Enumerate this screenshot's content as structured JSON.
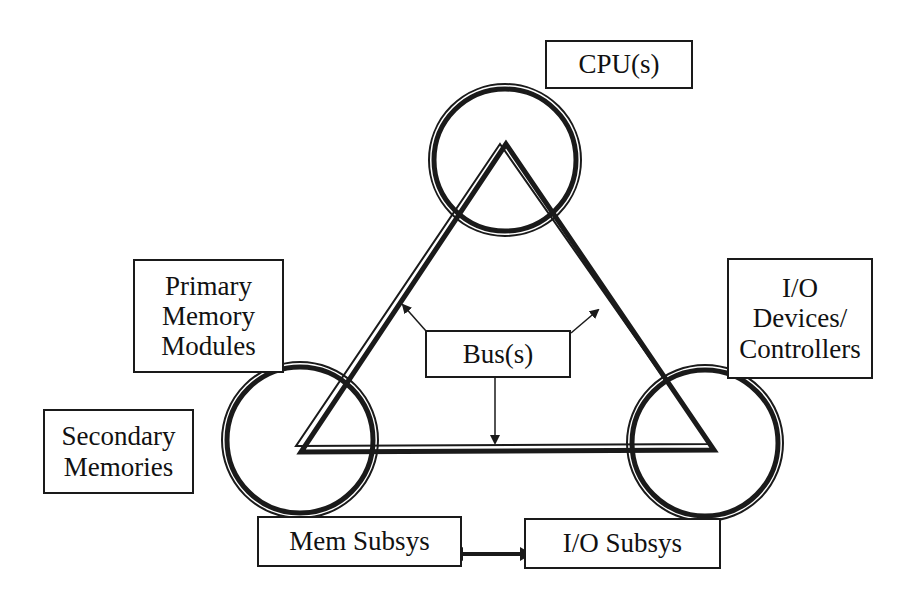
{
  "diagram": {
    "type": "system-architecture",
    "nodes": {
      "cpu": {
        "label": "CPU(s)"
      },
      "primary_memory": {
        "lines": [
          "Primary",
          "Memory",
          "Modules"
        ]
      },
      "secondary_memory": {
        "lines": [
          "Secondary",
          "Memories"
        ]
      },
      "io_devices": {
        "lines": [
          "I/O",
          "Devices/",
          "Controllers"
        ]
      },
      "bus": {
        "label": "Bus(s)"
      },
      "mem_subsys": {
        "label": "Mem Subsys"
      },
      "io_subsys": {
        "label": "I/O Subsys"
      }
    },
    "edges": [
      {
        "from": "cpu",
        "to": "mem_subsys",
        "kind": "bus"
      },
      {
        "from": "cpu",
        "to": "io_subsys",
        "kind": "bus"
      },
      {
        "from": "mem_subsys",
        "to": "io_subsys",
        "kind": "bus"
      },
      {
        "from": "mem_subsys",
        "to": "io_subsys",
        "kind": "bidirectional-arrow"
      },
      {
        "from": "bus",
        "to": "triangle-left-side",
        "kind": "pointer-arrow"
      },
      {
        "from": "bus",
        "to": "triangle-right-side",
        "kind": "pointer-arrow"
      },
      {
        "from": "bus",
        "to": "triangle-bottom-side",
        "kind": "pointer-arrow"
      }
    ],
    "colors": {
      "ink": "#1a1a1a",
      "background": "#ffffff"
    }
  }
}
